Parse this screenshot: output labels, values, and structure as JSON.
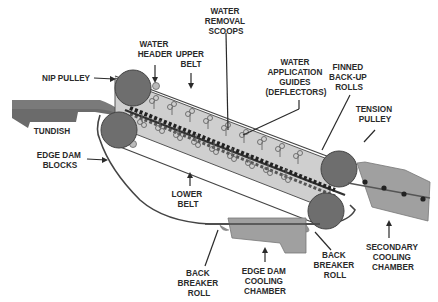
{
  "diagram": {
    "type": "twin-belt continuous caster schematic",
    "colors": {
      "belt_fill": "#c9c9c9",
      "belt_outline": "#555555",
      "pulley_fill": "#6e6e6e",
      "tundish_fill": "#6b6b6b",
      "chamber_fill": "#a0a0a0",
      "text": "#2a2a2a"
    },
    "labels": {
      "water_removal_scoops": [
        "WATER",
        "REMOVAL",
        "SCOOPS"
      ],
      "water_header": [
        "WATER",
        "HEADER"
      ],
      "upper_belt": [
        "UPPER",
        "BELT"
      ],
      "water_application_guides": [
        "WATER",
        "APPLICATION",
        "GUIDES",
        "(DEFLECTORS)"
      ],
      "finned_back_up_rolls": [
        "FINNED",
        "BACK-UP",
        "ROLLS"
      ],
      "nip_pulley": "NIP PULLEY",
      "tension_pulley": [
        "TENSION",
        "PULLEY"
      ],
      "tundish": "TUNDISH",
      "edge_dam_blocks": [
        "EDGE DAM",
        "BLOCKS"
      ],
      "lower_belt": [
        "LOWER",
        "BELT"
      ],
      "back_breaker_roll_left": [
        "BACK",
        "BREAKER",
        "ROLL"
      ],
      "edge_dam_cooling_chamber": [
        "EDGE DAM",
        "COOLING",
        "CHAMBER"
      ],
      "back_breaker_roll_right": [
        "BACK",
        "BREAKER",
        "ROLL"
      ],
      "secondary_cooling_chamber": [
        "SECONDARY",
        "COOLING",
        "CHAMBER"
      ]
    }
  }
}
